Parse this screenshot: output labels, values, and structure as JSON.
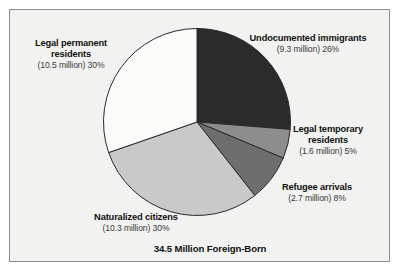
{
  "chart_data": {
    "type": "pie",
    "title": "34.5 Million Foreign-Born",
    "subtitle": "",
    "xlabel": "",
    "ylabel": "",
    "total_label": "34.5 Million Foreign-Born",
    "total_millions": 34.5,
    "units": "million",
    "legend_position": "callout-labels",
    "grid": false,
    "start_angle_deg": 0,
    "direction": "clockwise",
    "categories": [
      "Undocumented immigrants",
      "Legal temporary residents",
      "Refugee arrivals",
      "Naturalized citizens",
      "Legal permanent residents"
    ],
    "values": [
      26,
      5,
      8,
      30,
      30
    ],
    "value_millions": [
      9.3,
      1.6,
      2.7,
      10.3,
      10.5
    ],
    "colors": [
      "#2b2b2b",
      "#8d8d8d",
      "#6e6e6e",
      "#c9c9c9",
      "#fbfbfa"
    ],
    "slices": [
      {
        "name": "Undocumented immigrants",
        "label": "Undocumented immigrants",
        "value_text": "(9.3 million) 26%",
        "millions": 9.3,
        "percent": 26,
        "color": "#2b2b2b"
      },
      {
        "name": "Legal temporary residents",
        "label": "Legal temporary residents",
        "value_text": "(1.6 million) 5%",
        "millions": 1.6,
        "percent": 5,
        "color": "#8d8d8d"
      },
      {
        "name": "Refugee arrivals",
        "label": "Refugee arrivals",
        "value_text": "(2.7 million) 8%",
        "millions": 2.7,
        "percent": 8,
        "color": "#6e6e6e"
      },
      {
        "name": "Naturalized citizens",
        "label": "Naturalized citizens",
        "value_text": "(10.3 million) 30%",
        "millions": 10.3,
        "percent": 30,
        "color": "#c9c9c9"
      },
      {
        "name": "Legal permanent residents",
        "label": "Legal permanent residents",
        "value_text": "(10.5 million) 30%",
        "millions": 10.5,
        "percent": 30,
        "color": "#fbfbfa"
      }
    ]
  },
  "labels": {
    "legal_permanent": {
      "line1": "Legal permanent",
      "line2": "residents",
      "value": "(10.5 million) 30%"
    },
    "undocumented": {
      "line1": "Undocumented immigrants",
      "line2": "",
      "value": "(9.3 million) 26%"
    },
    "legal_temporary": {
      "line1": "Legal temporary",
      "line2": "residents",
      "value": "(1.6 million) 5%"
    },
    "refugee": {
      "line1": "Refugee arrivals",
      "line2": "",
      "value": "(2.7 million) 8%"
    },
    "naturalized": {
      "line1": "Naturalized citizens",
      "line2": "",
      "value": "(10.3 million) 30%"
    }
  },
  "style": {
    "frame_border": "#8d8d8d",
    "panel_background": "#f2f2f0",
    "text_color": "#111111",
    "value_color": "#3a3a3a",
    "slice_outline": "#2a2a2a"
  }
}
